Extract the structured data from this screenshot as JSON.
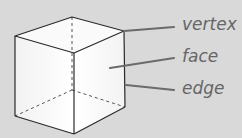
{
  "diagram": {
    "labels": {
      "vertex": "vertex",
      "face": "face",
      "edge": "edge"
    },
    "colors": {
      "background": "#d9d9d9",
      "edge": "#2a2a2a",
      "leader": "#6b6b6b",
      "label": "#666666"
    }
  }
}
